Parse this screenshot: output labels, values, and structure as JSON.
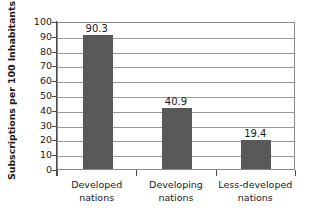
{
  "chart_data": {
    "type": "bar",
    "title": "",
    "xlabel": "",
    "ylabel": "Subscriptions per 100 Inhabitants",
    "categories": [
      "Developed nations",
      "Developing nations",
      "Less-developed nations"
    ],
    "category_lines": [
      [
        "Developed",
        "nations"
      ],
      [
        "Developing",
        "nations"
      ],
      [
        "Less-developed",
        "nations"
      ]
    ],
    "values": [
      90.3,
      40.9,
      19.4
    ],
    "value_labels": [
      "90.3",
      "40.9",
      "19.4"
    ],
    "ylim": [
      0,
      100
    ],
    "ytick_step": 10,
    "yticks": [
      100,
      90,
      80,
      70,
      60,
      50,
      40,
      30,
      20,
      10,
      0
    ],
    "ytick_labels": [
      "100",
      "90",
      "80",
      "70",
      "60",
      "50",
      "40",
      "30",
      "20",
      "10",
      "0"
    ],
    "grid": true,
    "grid_axis": "y",
    "legend": false,
    "legend_position": "none",
    "bar_color": "#595959",
    "plot_border_color": "#8a8a8a",
    "gridline_color": "#9a9a9a",
    "axis_color": "#4a4a4a",
    "background_color": "#ffffff",
    "text_color": "#1a1a1a"
  }
}
